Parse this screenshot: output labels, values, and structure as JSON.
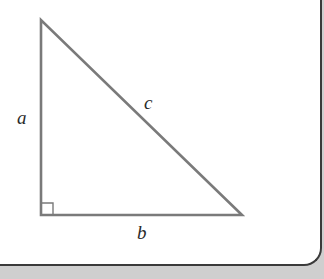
{
  "diagram": {
    "type": "right-triangle",
    "labels": {
      "side_a": "a",
      "side_b": "b",
      "side_c": "c"
    },
    "colors": {
      "stroke": "#7a7a7a",
      "label": "#2a2a2a",
      "background": "#ffffff",
      "footer_band": "#cfcfcf",
      "border": "#3a3a3a"
    },
    "right_angle_marker": true
  }
}
